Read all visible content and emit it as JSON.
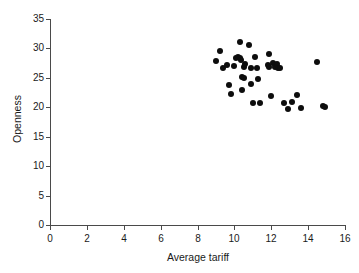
{
  "chart_data": {
    "type": "scatter",
    "title": "",
    "xlabel": "Average tariff",
    "ylabel": "Openness",
    "xlim": [
      0,
      16
    ],
    "ylim": [
      0,
      35
    ],
    "xticks": [
      0,
      2,
      4,
      6,
      8,
      10,
      12,
      14,
      16
    ],
    "yticks": [
      0,
      5,
      10,
      15,
      20,
      25,
      30,
      35
    ],
    "grid": false,
    "legend": null,
    "marker_color": "#0d0d0d",
    "axis_color": "#4a4a4a",
    "points": [
      {
        "x": 9.0,
        "y": 27.8
      },
      {
        "x": 9.2,
        "y": 29.5
      },
      {
        "x": 9.4,
        "y": 26.6
      },
      {
        "x": 9.6,
        "y": 27.2
      },
      {
        "x": 9.7,
        "y": 23.8
      },
      {
        "x": 9.8,
        "y": 22.2
      },
      {
        "x": 10.0,
        "y": 27.0
      },
      {
        "x": 10.1,
        "y": 28.4
      },
      {
        "x": 10.2,
        "y": 28.6
      },
      {
        "x": 10.3,
        "y": 28.3
      },
      {
        "x": 10.3,
        "y": 31.1
      },
      {
        "x": 10.35,
        "y": 28.0
      },
      {
        "x": 10.4,
        "y": 25.1
      },
      {
        "x": 10.4,
        "y": 22.9
      },
      {
        "x": 10.5,
        "y": 26.9
      },
      {
        "x": 10.5,
        "y": 24.9
      },
      {
        "x": 10.6,
        "y": 27.3
      },
      {
        "x": 10.8,
        "y": 30.5
      },
      {
        "x": 10.9,
        "y": 26.6
      },
      {
        "x": 10.9,
        "y": 23.9
      },
      {
        "x": 11.0,
        "y": 20.8
      },
      {
        "x": 11.1,
        "y": 28.5
      },
      {
        "x": 11.2,
        "y": 26.7
      },
      {
        "x": 11.3,
        "y": 24.8
      },
      {
        "x": 11.4,
        "y": 20.8
      },
      {
        "x": 11.8,
        "y": 27.2
      },
      {
        "x": 11.9,
        "y": 29.0
      },
      {
        "x": 11.9,
        "y": 26.9
      },
      {
        "x": 12.0,
        "y": 21.9
      },
      {
        "x": 12.1,
        "y": 27.5
      },
      {
        "x": 12.2,
        "y": 26.8
      },
      {
        "x": 12.3,
        "y": 27.3
      },
      {
        "x": 12.35,
        "y": 26.6
      },
      {
        "x": 12.5,
        "y": 26.7
      },
      {
        "x": 12.7,
        "y": 20.7
      },
      {
        "x": 12.9,
        "y": 19.7
      },
      {
        "x": 13.1,
        "y": 20.9
      },
      {
        "x": 13.4,
        "y": 22.1
      },
      {
        "x": 13.6,
        "y": 19.8
      },
      {
        "x": 14.5,
        "y": 27.7
      },
      {
        "x": 14.8,
        "y": 20.2
      },
      {
        "x": 14.9,
        "y": 20.1
      }
    ]
  }
}
